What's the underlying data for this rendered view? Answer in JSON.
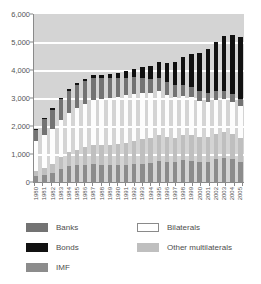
{
  "chart_data": {
    "type": "bar",
    "stacked": true,
    "title": "",
    "subtitle": "",
    "xlabel": "",
    "ylabel": "",
    "ylim": [
      0,
      6000
    ],
    "ytick_values": [
      0,
      1000,
      2000,
      3000,
      4000,
      5000,
      6000
    ],
    "ytick_labels": [
      "0",
      "1,000",
      "2,000",
      "3,000",
      "4,000",
      "5,000",
      "6,000"
    ],
    "grid": true,
    "grid_axis": "y",
    "legend_position": "bottom",
    "plot_background": "#d4d4d4",
    "categories": [
      "1980",
      "1981",
      "1982",
      "1983",
      "1984",
      "1985",
      "1986",
      "1987",
      "1988",
      "1989",
      "1990",
      "1991",
      "1992",
      "1993",
      "1994",
      "1995",
      "1996",
      "1997",
      "1998",
      "1999",
      "2000",
      "2001",
      "2002",
      "2003",
      "2004",
      "2005"
    ],
    "series": [
      {
        "name": "IMF",
        "color": "#8c8c8c",
        "values": [
          220,
          260,
          330,
          470,
          560,
          600,
          620,
          630,
          610,
          600,
          590,
          610,
          640,
          660,
          680,
          760,
          720,
          700,
          780,
          760,
          700,
          720,
          820,
          860,
          820,
          700
        ]
      },
      {
        "name": "Other multilaterals",
        "color": "#bfbfbf",
        "values": [
          180,
          250,
          330,
          420,
          500,
          560,
          620,
          680,
          700,
          720,
          760,
          800,
          840,
          880,
          900,
          920,
          900,
          880,
          900,
          920,
          900,
          880,
          900,
          920,
          900,
          880
        ]
      },
      {
        "name": "Bilaterals",
        "color": "#ffffff",
        "values": [
          1050,
          1180,
          1250,
          1320,
          1400,
          1480,
          1560,
          1620,
          1650,
          1680,
          1700,
          1700,
          1680,
          1650,
          1600,
          1560,
          1500,
          1450,
          1400,
          1350,
          1300,
          1250,
          1200,
          1180,
          1150,
          1120
        ]
      },
      {
        "name": "Banks",
        "color": "#737373",
        "values": [
          420,
          560,
          680,
          740,
          800,
          820,
          800,
          780,
          740,
          700,
          660,
          620,
          580,
          540,
          500,
          470,
          440,
          420,
          400,
          380,
          360,
          340,
          320,
          300,
          290,
          280
        ]
      },
      {
        "name": "Bonds",
        "color": "#111111",
        "values": [
          30,
          40,
          50,
          60,
          70,
          80,
          90,
          110,
          130,
          160,
          200,
          240,
          300,
          380,
          460,
          560,
          680,
          820,
          980,
          1160,
          1360,
          1560,
          1760,
          1960,
          2100,
          2200
        ]
      }
    ]
  },
  "legend": {
    "items": [
      {
        "label": "Banks",
        "color": "#737373",
        "border": "none"
      },
      {
        "label": "Bonds",
        "color": "#111111",
        "border": "none"
      },
      {
        "label": "IMF",
        "color": "#8c8c8c",
        "border": "none"
      },
      {
        "label": "Bilaterals",
        "color": "#ffffff",
        "border": "1px solid #8a8a8a"
      },
      {
        "label": "Other multilaterals",
        "color": "#bfbfbf",
        "border": "none"
      }
    ]
  }
}
